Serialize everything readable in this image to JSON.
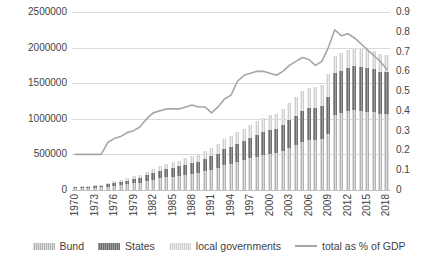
{
  "chart_data": {
    "type": "bar",
    "title": "",
    "subtitle": "",
    "xlabel": "",
    "ylabel": "",
    "y2label": "",
    "grid": true,
    "legend_position": "bottom",
    "ylim": [
      0,
      2500000
    ],
    "y2lim": [
      0,
      0.9
    ],
    "yticks": [
      "0",
      "500000",
      "1000000",
      "1500000",
      "2000000",
      "2500000"
    ],
    "ytick_values": [
      0,
      500000,
      1000000,
      1500000,
      2000000,
      2500000
    ],
    "y2ticks": [
      "0",
      "0.1",
      "0.2",
      "0.3",
      "0.4",
      "0.5",
      "0.6",
      "0.7",
      "0.8",
      "0.9"
    ],
    "y2tick_values": [
      0,
      0.1,
      0.2,
      0.3,
      0.4,
      0.5,
      0.6,
      0.7,
      0.8,
      0.9
    ],
    "categories": [
      "1970",
      "1971",
      "1972",
      "1973",
      "1974",
      "1975",
      "1976",
      "1977",
      "1978",
      "1979",
      "1980",
      "1981",
      "1982",
      "1983",
      "1984",
      "1985",
      "1986",
      "1987",
      "1988",
      "1989",
      "1990",
      "1991",
      "1992",
      "1993",
      "1994",
      "1995",
      "1996",
      "1997",
      "1998",
      "1999",
      "2000",
      "2001",
      "2002",
      "2003",
      "2004",
      "2005",
      "2006",
      "2007",
      "2008",
      "2009",
      "2010",
      "2011",
      "2012",
      "2013",
      "2014",
      "2015",
      "2016",
      "2017",
      "2018"
    ],
    "xtick_labels": [
      "1970",
      "",
      "",
      "1973",
      "",
      "",
      "1976",
      "",
      "",
      "1979",
      "",
      "",
      "1982",
      "",
      "",
      "1985",
      "",
      "",
      "1988",
      "",
      "",
      "1991",
      "",
      "",
      "1994",
      "",
      "",
      "1997",
      "",
      "",
      "2000",
      "",
      "",
      "2003",
      "",
      "",
      "2006",
      "",
      "",
      "2009",
      "",
      "",
      "2012",
      "",
      "",
      "2015",
      "",
      "",
      "2018"
    ],
    "series": [
      {
        "name": "Bund",
        "color": "#b3b3b3",
        "type": "bar",
        "stack": "debt",
        "axis": "left",
        "values": [
          22000,
          25000,
          28000,
          31000,
          36000,
          48000,
          60000,
          69000,
          80000,
          92000,
          105000,
          124000,
          144000,
          162000,
          177000,
          189000,
          201000,
          215000,
          231000,
          240000,
          264000,
          287000,
          311000,
          350000,
          371000,
          396000,
          420000,
          444000,
          470000,
          492000,
          510000,
          522000,
          552000,
          594000,
          634000,
          673000,
          696000,
          700000,
          718000,
          790000,
          1060000,
          1080000,
          1105000,
          1120000,
          1115000,
          1100000,
          1090000,
          1070000,
          1065000
        ]
      },
      {
        "name": "States",
        "color": "#6e6e6e",
        "type": "bar",
        "stack": "debt",
        "axis": "left",
        "values": [
          14000,
          16000,
          18000,
          20000,
          24000,
          31000,
          39000,
          45000,
          52000,
          60000,
          69000,
          81000,
          94000,
          105000,
          114000,
          122000,
          130000,
          139000,
          149000,
          155000,
          170000,
          185000,
          201000,
          226000,
          239000,
          256000,
          271000,
          287000,
          304000,
          318000,
          330000,
          337000,
          357000,
          384000,
          410000,
          435000,
          450000,
          453000,
          464000,
          511000,
          583000,
          597000,
          610000,
          620000,
          616000,
          608000,
          603000,
          592000,
          589000
        ]
      },
      {
        "name": "local governments",
        "color": "#cfcfcf",
        "type": "bar",
        "stack": "debt",
        "axis": "left",
        "values": [
          9000,
          10000,
          11000,
          13000,
          15000,
          20000,
          25000,
          29000,
          33000,
          38000,
          44000,
          52000,
          60000,
          67000,
          73000,
          78000,
          83000,
          89000,
          95000,
          99000,
          109000,
          118000,
          128000,
          144000,
          153000,
          163000,
          173000,
          183000,
          194000,
          203000,
          210000,
          215000,
          228000,
          245000,
          261000,
          277000,
          287000,
          289000,
          296000,
          326000,
          245000,
          251000,
          256000,
          260000,
          259000,
          255000,
          253000,
          249000,
          247000
        ]
      },
      {
        "name": "total as % of GDP",
        "color": "#a6a6a6",
        "type": "line",
        "axis": "right",
        "values": [
          0.18,
          0.18,
          0.18,
          0.18,
          0.18,
          0.24,
          0.26,
          0.27,
          0.29,
          0.3,
          0.32,
          0.36,
          0.39,
          0.4,
          0.41,
          0.41,
          0.41,
          0.42,
          0.43,
          0.42,
          0.42,
          0.39,
          0.42,
          0.46,
          0.48,
          0.55,
          0.58,
          0.59,
          0.6,
          0.6,
          0.59,
          0.58,
          0.6,
          0.63,
          0.65,
          0.67,
          0.66,
          0.63,
          0.65,
          0.72,
          0.81,
          0.78,
          0.79,
          0.77,
          0.74,
          0.71,
          0.68,
          0.65,
          0.61
        ]
      }
    ]
  },
  "legend": {
    "items": [
      {
        "label": "Bund",
        "swatch": "sw-bund",
        "kind": "box"
      },
      {
        "label": "States",
        "swatch": "sw-states",
        "kind": "box"
      },
      {
        "label": "local governments",
        "swatch": "sw-local",
        "kind": "box"
      },
      {
        "label": "total as % of GDP",
        "swatch": "sw-line",
        "kind": "line"
      }
    ]
  }
}
